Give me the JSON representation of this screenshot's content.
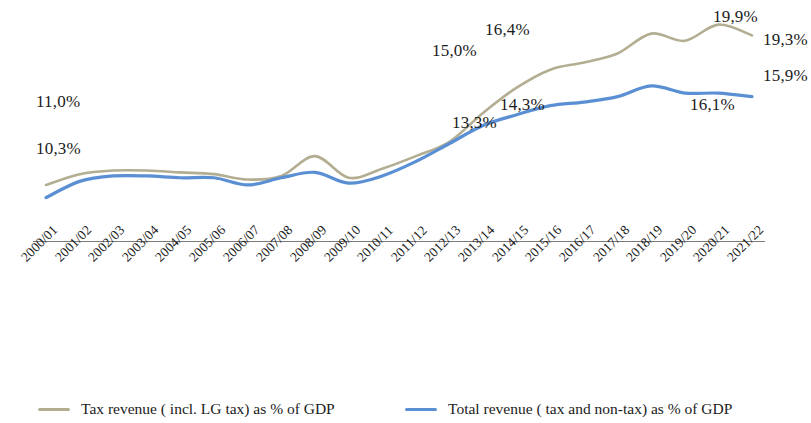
{
  "chart_data": {
    "type": "line",
    "title": "",
    "subtitle": "",
    "xlabel": "",
    "ylabel": "",
    "grid": false,
    "legend_position": "bottom",
    "ylim": [
      9.5,
      20.6
    ],
    "categories": [
      "2000/01",
      "2001/02",
      "2002/03",
      "2003/04",
      "2004/05",
      "2005/06",
      "2006/07",
      "2007/08",
      "2008/09",
      "2009/10",
      "2010/11",
      "2011/12",
      "2012/13",
      "2013/14",
      "2014/15",
      "2015/16",
      "2016/17",
      "2017/18",
      "2018/19",
      "2019/20",
      "2020/21",
      "2021/22"
    ],
    "series": [
      {
        "name": "Tax revenue ( incl. LG tax) as % of GDP",
        "color": "#b3ad92",
        "values": [
          11.0,
          11.6,
          11.8,
          11.8,
          11.7,
          11.6,
          11.3,
          11.5,
          12.6,
          11.4,
          11.9,
          12.6,
          13.4,
          15.0,
          16.4,
          17.4,
          17.8,
          18.3,
          19.4,
          19.0,
          19.9,
          19.3
        ]
      },
      {
        "name": "Total revenue ( tax and non-tax) as % of GDP",
        "color": "#5b8fd4",
        "values": [
          10.3,
          11.2,
          11.5,
          11.5,
          11.4,
          11.4,
          11.0,
          11.4,
          11.7,
          11.1,
          11.5,
          12.3,
          13.3,
          14.3,
          14.9,
          15.4,
          15.6,
          15.9,
          16.5,
          16.1,
          16.1,
          15.9
        ]
      }
    ],
    "annotations": [
      {
        "text": "11,0%",
        "series": "Tax revenue ( incl. LG tax) as % of GDP",
        "category": "2000/01",
        "x": 36,
        "y": 92
      },
      {
        "text": "10,3%",
        "series": "Total revenue ( tax and non-tax) as % of GDP",
        "category": "2000/01",
        "x": 36,
        "y": 139
      },
      {
        "text": "15,0%",
        "series": "Tax revenue ( incl. LG tax) as % of GDP",
        "category": "2013/14",
        "x": 432,
        "y": 41
      },
      {
        "text": "16,4%",
        "series": "Tax revenue ( incl. LG tax) as % of GDP",
        "category": "2014/15",
        "x": 485,
        "y": 20
      },
      {
        "text": "13,3%",
        "series": "Total revenue ( tax and non-tax) as % of GDP",
        "category": "2012/13",
        "x": 452,
        "y": 113
      },
      {
        "text": "14,3%",
        "series": "Total revenue ( tax and non-tax) as % of GDP",
        "category": "2013/14",
        "x": 500,
        "y": 95
      },
      {
        "text": "19,9%",
        "series": "Tax revenue ( incl. LG tax) as % of GDP",
        "category": "2020/21",
        "x": 713,
        "y": 7
      },
      {
        "text": "19,3%",
        "series": "Tax revenue ( incl. LG tax) as % of GDP",
        "category": "2021/22",
        "x": 763,
        "y": 30
      },
      {
        "text": "15,9%",
        "series": "Total revenue ( tax and non-tax) as % of GDP",
        "category": "2021/22",
        "x": 763,
        "y": 66
      },
      {
        "text": "16,1%",
        "series": "Total revenue ( tax and non-tax) as % of GDP",
        "category": "2019/20",
        "x": 690,
        "y": 95
      }
    ]
  },
  "legend": {
    "entries": [
      {
        "label": "Tax revenue ( incl. LG tax) as % of GDP",
        "color": "#b3ad92",
        "x": 38
      },
      {
        "label": "Total revenue ( tax and non-tax) as % of GDP",
        "color": "#5b8fd4",
        "x": 405
      }
    ]
  },
  "axis": {
    "baseline_color": "#7a7a7a"
  }
}
